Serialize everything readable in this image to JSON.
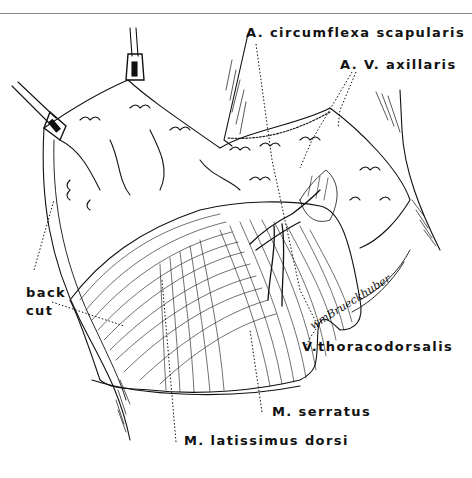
{
  "figure": {
    "type": "anatomical line illustration",
    "signature": "wmBrueckhuber",
    "colors": {
      "ink": "#111111",
      "paper": "#ffffff",
      "rule": "#8a8a8a"
    }
  },
  "labels": {
    "a_circumflexa_scapularis": "A. circumflexa scapularis",
    "a_v_axillaris": "A. V. axillaris",
    "back": "back",
    "cut": "cut",
    "v_thoracodorsalis": "V.thoracodorsalis",
    "m_serratus": "M. serratus",
    "m_latissimus_dorsi": "M. latissimus dorsi"
  }
}
